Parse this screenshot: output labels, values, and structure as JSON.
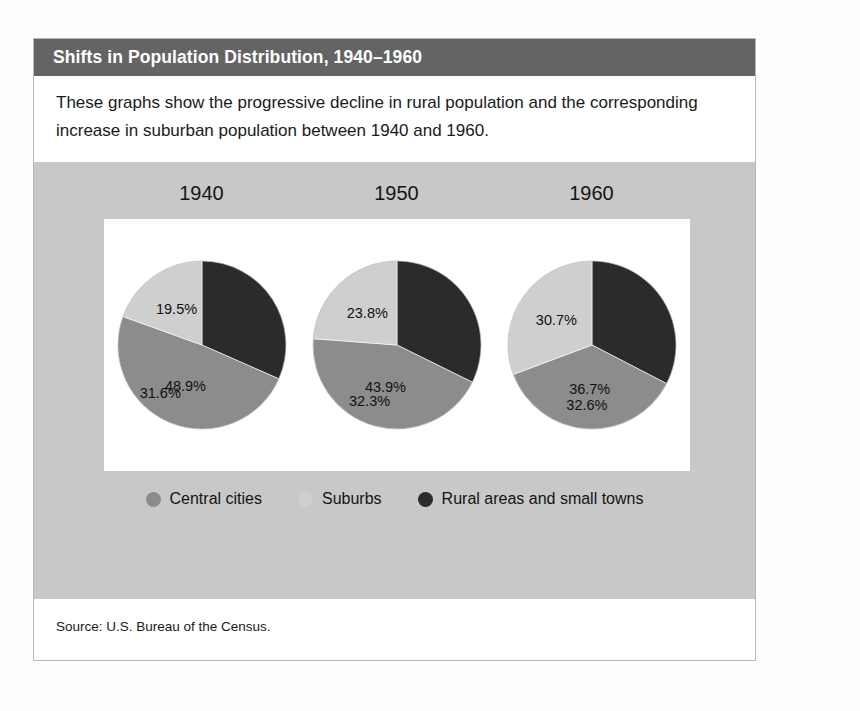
{
  "title": "Shifts in Population Distribution, 1940–1960",
  "description": "These graphs show the progressive decline in rural population and the corresponding increase in suburban population between 1940 and 1960.",
  "source": "Source: U.S. Bureau of the Census.",
  "colors": {
    "title_bar": "#646464",
    "panel": "#c8c8c8",
    "plot_background": "#ffffff",
    "central_cities": "#8c8c8c",
    "suburbs": "#cfcfcf",
    "rural": "#2b2b2b",
    "card_border": "#b9b9b9"
  },
  "legend": {
    "items": [
      {
        "label": "Central cities",
        "color": "#8c8c8c",
        "key": "central_cities"
      },
      {
        "label": "Suburbs",
        "color": "#cfcfcf",
        "key": "suburbs"
      },
      {
        "label": "Rural areas and small towns",
        "color": "#2b2b2b",
        "key": "rural"
      }
    ]
  },
  "chart_data": {
    "type": "pie",
    "title": "Shifts in Population Distribution, 1940–1960",
    "subtitle": "These graphs show the progressive decline in rural population and the corresponding increase in suburban population between 1940 and 1960.",
    "legend_position": "bottom",
    "units": "percent of total population",
    "categories": [
      "Central cities",
      "Suburbs",
      "Rural areas and small towns"
    ],
    "panels": [
      {
        "year": "1940",
        "labels": [
          "48.9%",
          "19.5%",
          "31.6%"
        ],
        "slices": [
          {
            "name": "Central cities",
            "value": 48.9,
            "label": "48.9%",
            "color": "#8c8c8c"
          },
          {
            "name": "Suburbs",
            "value": 19.5,
            "label": "19.5%",
            "color": "#cfcfcf"
          },
          {
            "name": "Rural areas and small towns",
            "value": 31.6,
            "label": "31.6%",
            "color": "#2b2b2b"
          }
        ]
      },
      {
        "year": "1950",
        "labels": [
          "43.9%",
          "23.8%",
          "32.3%"
        ],
        "slices": [
          {
            "name": "Central cities",
            "value": 43.9,
            "label": "43.9%",
            "color": "#8c8c8c"
          },
          {
            "name": "Suburbs",
            "value": 23.8,
            "label": "23.8%",
            "color": "#cfcfcf"
          },
          {
            "name": "Rural areas and small towns",
            "value": 32.3,
            "label": "32.3%",
            "color": "#2b2b2b"
          }
        ]
      },
      {
        "year": "1960",
        "labels": [
          "36.7%",
          "30.7%",
          "32.6%"
        ],
        "slices": [
          {
            "name": "Central cities",
            "value": 36.7,
            "label": "36.7%",
            "color": "#8c8c8c"
          },
          {
            "name": "Suburbs",
            "value": 30.7,
            "label": "30.7%",
            "color": "#cfcfcf"
          },
          {
            "name": "Rural areas and small towns",
            "value": 32.6,
            "label": "32.6%",
            "color": "#2b2b2b"
          }
        ]
      }
    ]
  },
  "years": [
    "1940",
    "1950",
    "1960"
  ]
}
